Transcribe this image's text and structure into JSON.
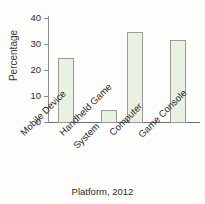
{
  "chart_data": {
    "type": "bar",
    "title": "",
    "subtitle": "",
    "xlabel": "Platform, 2012",
    "ylabel": "Percentage",
    "categories": [
      "Mobile Device",
      "Handheld Game System",
      "Computer",
      "Game Console"
    ],
    "category_lines": [
      [
        "Mobile Device"
      ],
      [
        "Handheld Game",
        "System"
      ],
      [
        "Computer"
      ],
      [
        "Game Console"
      ]
    ],
    "values": [
      25,
      5,
      35,
      32
    ],
    "ylim": [
      0,
      40
    ],
    "yticks": [
      0,
      10,
      20,
      30,
      40
    ],
    "ytick_labels": [
      "0",
      "10",
      "20",
      "30",
      "40"
    ],
    "grid": false,
    "legend": false,
    "legend_position": "none",
    "bar_fill_color": "#e9f1e3",
    "bar_border_color": "#9a9a9a",
    "axis_color": "#8c8c8c",
    "text_color": "#2b2b2b",
    "background_color": "#fdfdfc"
  }
}
